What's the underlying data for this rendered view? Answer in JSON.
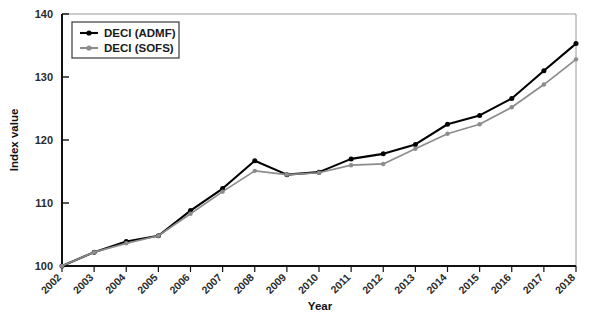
{
  "chart_data": {
    "type": "line",
    "title": "",
    "xlabel": "Year",
    "ylabel": "Index value",
    "categories": [
      2002,
      2003,
      2004,
      2005,
      2006,
      2007,
      2008,
      2009,
      2010,
      2011,
      2012,
      2013,
      2014,
      2015,
      2016,
      2017,
      2018
    ],
    "xtick_labels": [
      "2002",
      "2003",
      "2004",
      "2005",
      "2006",
      "2007",
      "2008",
      "2009",
      "2010",
      "2011",
      "2012",
      "2013",
      "2014",
      "2015",
      "2016",
      "2017",
      "2018"
    ],
    "ytick_labels": [
      "100",
      "110",
      "120",
      "130",
      "140"
    ],
    "yticks": [
      100,
      110,
      120,
      130,
      140
    ],
    "ylim": [
      100,
      140
    ],
    "xlim": [
      2002,
      2018
    ],
    "grid": false,
    "legend_position": "top-left",
    "series": [
      {
        "name": "DECI (ADMF)",
        "color": "#000000",
        "marker": "circle",
        "values": [
          100.0,
          102.2,
          103.9,
          104.8,
          108.8,
          112.3,
          116.7,
          114.5,
          114.9,
          117.0,
          117.8,
          119.3,
          122.5,
          123.9,
          126.6,
          131.0,
          135.3
        ]
      },
      {
        "name": "DECI (SOFS)",
        "color": "#8c8c8c",
        "marker": "circle",
        "values": [
          100.0,
          102.2,
          103.6,
          104.8,
          108.3,
          111.8,
          115.1,
          114.5,
          114.8,
          116.0,
          116.2,
          118.6,
          121.0,
          122.5,
          125.2,
          128.8,
          132.8
        ]
      }
    ]
  },
  "legend": {
    "items": [
      {
        "label": "DECI (ADMF)",
        "color": "#000000"
      },
      {
        "label": "DECI (SOFS)",
        "color": "#8c8c8c"
      }
    ]
  },
  "axes": {
    "y_title": "Index value",
    "x_title": "Year"
  }
}
